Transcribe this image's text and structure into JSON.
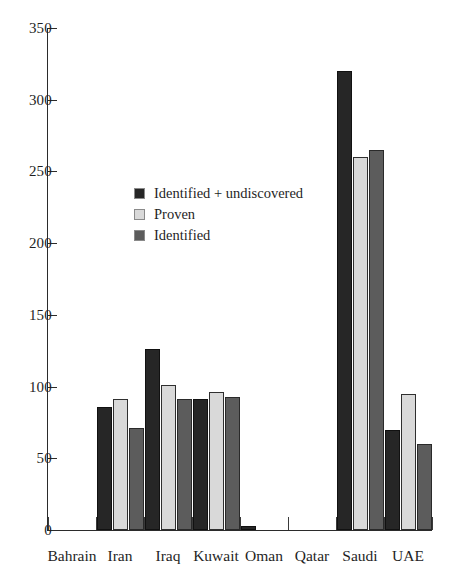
{
  "chart_data": {
    "type": "bar",
    "title": "",
    "subtitle": "",
    "xlabel": "",
    "ylabel": "",
    "ylim": [
      0,
      350
    ],
    "yticks": [
      0,
      50,
      100,
      150,
      200,
      250,
      300,
      350
    ],
    "ytick_labels": [
      "0",
      "50",
      "100",
      "150",
      "200",
      "250",
      "300",
      "350"
    ],
    "grid": false,
    "legend_position": "inside-upper-left",
    "categories": [
      "Bahrain",
      "Iran",
      "Iraq",
      "Kuwait",
      "Oman",
      "Qatar",
      "Saudi",
      "UAE"
    ],
    "series": [
      {
        "name": "Identified + undiscovered",
        "color": "#262626",
        "values": [
          0,
          86,
          126,
          91,
          3,
          0,
          320,
          70
        ]
      },
      {
        "name": "Proven",
        "color": "#d9d9d9",
        "values": [
          0,
          91,
          101,
          96,
          0,
          0,
          260,
          95
        ]
      },
      {
        "name": "Identified",
        "color": "#5c5c5c",
        "values": [
          0,
          71,
          91,
          93,
          0,
          0,
          265,
          60
        ]
      }
    ]
  },
  "colors": {
    "axis": "#2b2b2b",
    "text": "#1f1f1f",
    "background": "#ffffff",
    "series_identified_undiscovered": "#262626",
    "series_proven": "#d9d9d9",
    "series_identified": "#5c5c5c"
  }
}
